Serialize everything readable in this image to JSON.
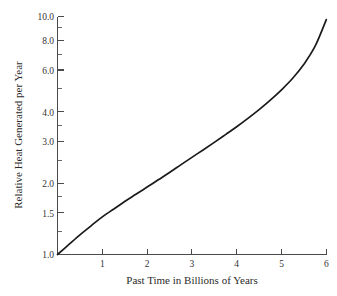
{
  "chart_data": {
    "type": "line",
    "title": "",
    "xlabel": "Past Time in Billions of Years",
    "ylabel": "Relative Heat Generated per Year",
    "xlim": [
      0,
      6
    ],
    "ylim": [
      1.0,
      10.0
    ],
    "yscale": "log",
    "xscale": "linear",
    "grid": false,
    "legend": false,
    "xticks": [
      1,
      2,
      3,
      4,
      5,
      6
    ],
    "xtick_labels": [
      "1",
      "2",
      "3",
      "4",
      "5",
      "6"
    ],
    "yticks": [
      1.0,
      1.5,
      2.0,
      3.0,
      4.0,
      6.0,
      8.0,
      10.0
    ],
    "ytick_labels": [
      "1.0",
      "1.5",
      "2.0",
      "3.0",
      "4.0",
      "6.0",
      "8.0",
      "10.0"
    ],
    "x": [
      0.0,
      0.25,
      0.5,
      0.75,
      1.0,
      1.25,
      1.5,
      1.75,
      2.0,
      2.25,
      2.5,
      2.75,
      3.0,
      3.25,
      3.5,
      3.75,
      4.0,
      4.25,
      4.5,
      4.75,
      5.0,
      5.25,
      5.5,
      5.75,
      6.0
    ],
    "values": [
      1.0,
      1.1,
      1.21,
      1.32,
      1.44,
      1.55,
      1.67,
      1.79,
      1.92,
      2.06,
      2.21,
      2.38,
      2.56,
      2.75,
      2.96,
      3.19,
      3.44,
      3.73,
      4.06,
      4.45,
      4.92,
      5.5,
      6.3,
      7.5,
      9.7
    ],
    "series": [
      {
        "name": "Relative heat generated per year",
        "values": [
          1.0,
          1.1,
          1.21,
          1.32,
          1.44,
          1.55,
          1.67,
          1.79,
          1.92,
          2.06,
          2.21,
          2.38,
          2.56,
          2.75,
          2.96,
          3.19,
          3.44,
          3.73,
          4.06,
          4.45,
          4.92,
          5.5,
          6.3,
          7.5,
          9.7
        ],
        "color": "#1a1a1a"
      }
    ],
    "annotations": []
  },
  "labels": {
    "y": {
      "t1_0": "1.0",
      "t1_5": "1.5",
      "t2_0": "2.0",
      "t3_0": "3.0",
      "t4_0": "4.0",
      "t6_0": "6.0",
      "t8_0": "8.0",
      "t10_0": "10.0"
    },
    "x": {
      "t1": "1",
      "t2": "2",
      "t3": "3",
      "t4": "4",
      "t5": "5",
      "t6": "6"
    }
  },
  "titles": {
    "x_axis": "Past Time in Billions of Years",
    "y_axis": "Relative Heat Generated per Year"
  },
  "colors": {
    "background": "#ffffff",
    "curve": "#1a1a1a",
    "axis": "#4a4a4a",
    "text": "#2b2b2b"
  }
}
